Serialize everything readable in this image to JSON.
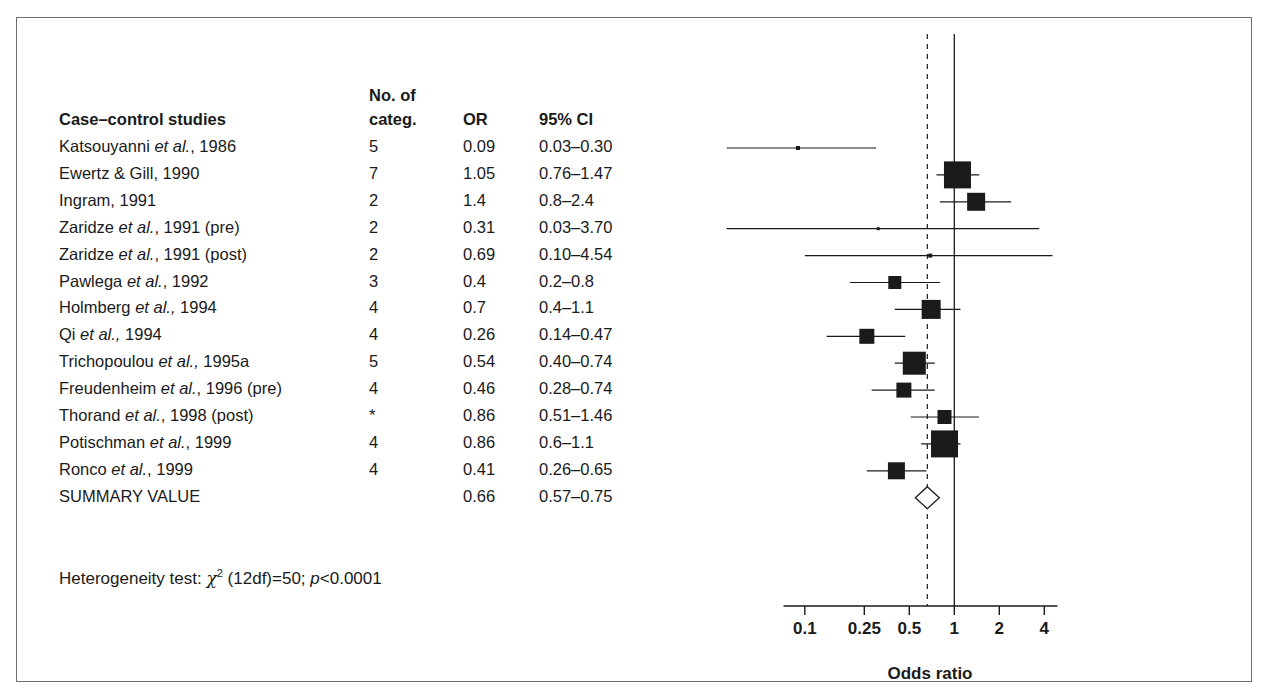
{
  "figure": {
    "table_headers": {
      "studies": "Case–control studies",
      "categ_line1": "No. of",
      "categ_line2": "categ.",
      "or": "OR",
      "ci": "95% CI"
    },
    "heterogeneity": {
      "prefix": "Heterogeneity test:",
      "statistic_symbol": "χ",
      "statistic_exponent": "2",
      "df": "(12df)=50;",
      "p_italic": "p",
      "p_value": "<0.0001",
      "full_text": "Heterogeneity test: χ2 (12df)=50; p<0.0001"
    },
    "axis": {
      "label": "Odds ratio",
      "ticks": [
        "0.1",
        "0.25",
        "0.5",
        "1",
        "2",
        "4"
      ],
      "tick_values": [
        0.1,
        0.25,
        0.5,
        1,
        2,
        4
      ],
      "null_line_value": 1,
      "summary_line_value": 0.66
    }
  },
  "chart_data": {
    "type": "forest",
    "title": "",
    "xlabel": "Odds ratio",
    "ylabel": "",
    "xscale": "log",
    "xlim": [
      0.07,
      5.2
    ],
    "xticks": [
      0.1,
      0.25,
      0.5,
      1,
      2,
      4
    ],
    "xticklabels": [
      "0.1",
      "0.25",
      "0.5",
      "1",
      "2",
      "4"
    ],
    "grid": false,
    "reference_lines": [
      {
        "value": 1,
        "style": "solid",
        "name": "null-effect-line"
      },
      {
        "value": 0.66,
        "style": "dashed",
        "name": "summary-effect-line"
      }
    ],
    "columns": [
      "Case–control studies",
      "No. of categ.",
      "OR",
      "95% CI"
    ],
    "rows": [
      {
        "study": "Katsouyanni ",
        "study_italic": "et al.",
        "study_tail": ", 1986",
        "categ": "5",
        "or": "0.09",
        "ci": "0.03–0.30",
        "or_value": 0.09,
        "ci_low": 0.03,
        "ci_high": 0.3,
        "weight": 4
      },
      {
        "study": "Ewertz & Gill, 1990",
        "study_italic": "",
        "study_tail": "",
        "categ": "7",
        "or": "1.05",
        "ci": "0.76–1.47",
        "or_value": 1.05,
        "ci_low": 0.76,
        "ci_high": 1.47,
        "weight": 27
      },
      {
        "study": "Ingram, 1991",
        "study_italic": "",
        "study_tail": "",
        "categ": "2",
        "or": "1.4",
        "ci": "0.8–2.4",
        "or_value": 1.4,
        "ci_low": 0.8,
        "ci_high": 2.4,
        "weight": 18
      },
      {
        "study": "Zaridze ",
        "study_italic": "et al.",
        "study_tail": ", 1991 (pre)",
        "categ": "2",
        "or": "0.31",
        "ci": "0.03–3.70",
        "or_value": 0.31,
        "ci_low": 0.03,
        "ci_high": 3.7,
        "weight": 3
      },
      {
        "study": "Zaridze ",
        "study_italic": "et al.",
        "study_tail": ", 1991 (post)",
        "categ": "2",
        "or": "0.69",
        "ci": "0.10–4.54",
        "or_value": 0.69,
        "ci_low": 0.1,
        "ci_high": 4.54,
        "weight": 4
      },
      {
        "study": "Pawlega ",
        "study_italic": "et al.",
        "study_tail": ", 1992",
        "categ": "3",
        "or": "0.4",
        "ci": "0.2–0.8",
        "or_value": 0.4,
        "ci_low": 0.2,
        "ci_high": 0.8,
        "weight": 13
      },
      {
        "study": "Holmberg ",
        "study_italic": "et al.,",
        "study_tail": " 1994",
        "categ": "4",
        "or": "0.7",
        "ci": "0.4–1.1",
        "or_value": 0.7,
        "ci_low": 0.4,
        "ci_high": 1.1,
        "weight": 19
      },
      {
        "study": "Qi ",
        "study_italic": "et al.,",
        "study_tail": " 1994",
        "categ": "4",
        "or": "0.26",
        "ci": "0.14–0.47",
        "or_value": 0.26,
        "ci_low": 0.14,
        "ci_high": 0.47,
        "weight": 15
      },
      {
        "study": "Trichopoulou ",
        "study_italic": "et al.,",
        "study_tail": " 1995a",
        "categ": "5",
        "or": "0.54",
        "ci": "0.40–0.74",
        "or_value": 0.54,
        "ci_low": 0.4,
        "ci_high": 0.74,
        "weight": 23
      },
      {
        "study": "Freudenheim ",
        "study_italic": "et al.",
        "study_tail": ", 1996 (pre)",
        "categ": "4",
        "or": "0.46",
        "ci": "0.28–0.74",
        "or_value": 0.46,
        "ci_low": 0.28,
        "ci_high": 0.74,
        "weight": 15
      },
      {
        "study": "Thorand ",
        "study_italic": "et al.",
        "study_tail": ", 1998 (post)",
        "categ": "*",
        "or": "0.86",
        "ci": "0.51–1.46",
        "or_value": 0.86,
        "ci_low": 0.51,
        "ci_high": 1.46,
        "weight": 14
      },
      {
        "study": "Potischman ",
        "study_italic": "et al.",
        "study_tail": ", 1999",
        "categ": "4",
        "or": "0.86",
        "ci": "0.6–1.1",
        "or_value": 0.86,
        "ci_low": 0.6,
        "ci_high": 1.1,
        "weight": 27
      },
      {
        "study": "Ronco ",
        "study_italic": "et al.",
        "study_tail": ", 1999",
        "categ": "4",
        "or": "0.41",
        "ci": "0.26–0.65",
        "or_value": 0.41,
        "ci_low": 0.26,
        "ci_high": 0.65,
        "weight": 17
      }
    ],
    "summary": {
      "study": "SUMMARY VALUE",
      "categ": "",
      "or": "0.66",
      "ci": "0.57–0.75",
      "or_value": 0.66,
      "ci_low": 0.57,
      "ci_high": 0.75,
      "marker": "diamond"
    },
    "annotations": [
      {
        "text": "Heterogeneity test: χ2 (12df)=50; p<0.0001",
        "name": "heterogeneity-test"
      }
    ]
  }
}
